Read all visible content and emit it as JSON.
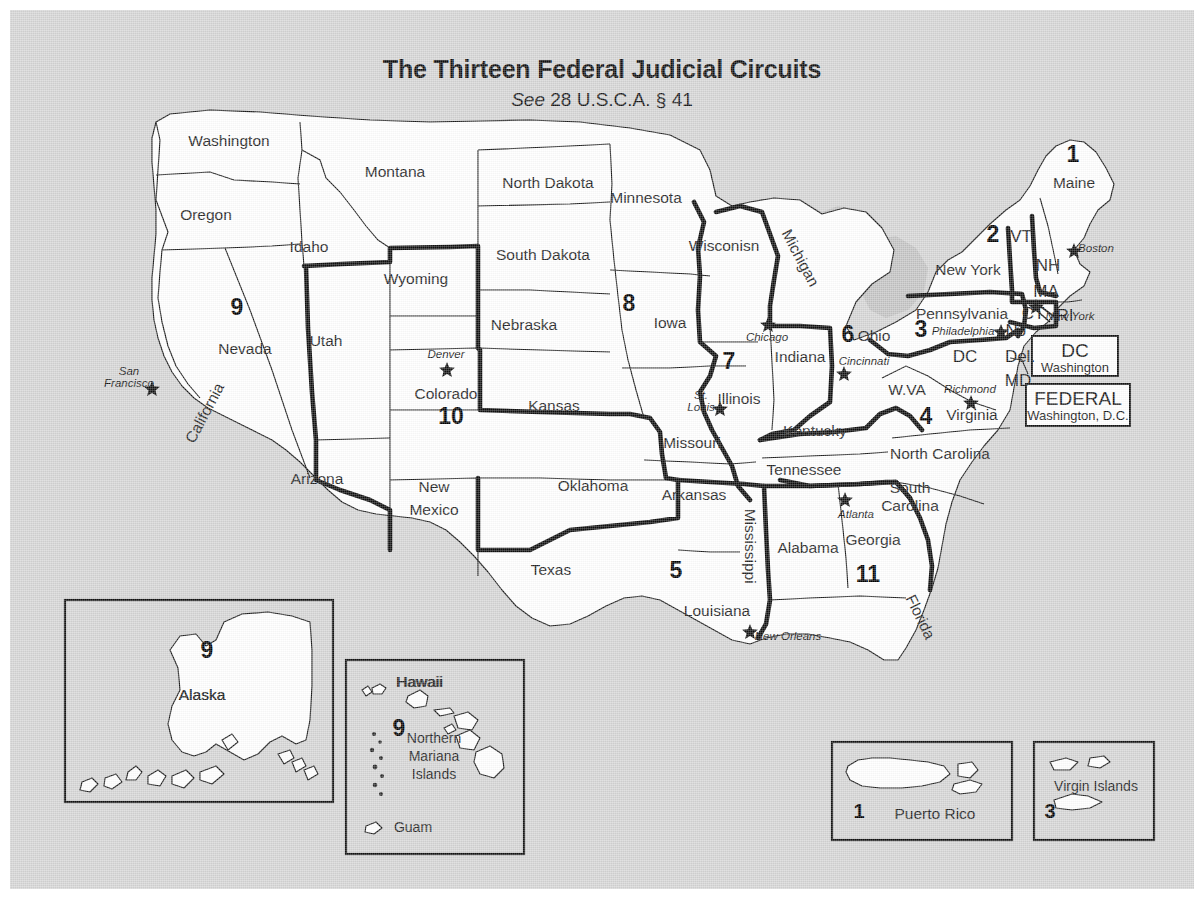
{
  "title": "The Thirteen Federal Judicial Circuits",
  "subtitle_italic": "See",
  "subtitle_rest": " 28 U.S.C.A. § 41",
  "colors": {
    "background": "#d5d5d5",
    "land": "#ffffff",
    "water": "#c3c3c3",
    "ink": "#111111",
    "circuit_boundary": "#0d0d0d"
  },
  "states": [
    {
      "name": "Washington",
      "x": 219,
      "y": 132
    },
    {
      "name": "Oregon",
      "x": 196,
      "y": 206
    },
    {
      "name": "Idaho",
      "x": 299,
      "y": 238
    },
    {
      "name": "Montana",
      "x": 385,
      "y": 163
    },
    {
      "name": "Wyoming",
      "x": 406,
      "y": 270
    },
    {
      "name": "Nevada",
      "x": 235,
      "y": 340
    },
    {
      "name": "Utah",
      "x": 316,
      "y": 332
    },
    {
      "name": "California",
      "x": 195,
      "y": 404,
      "rotate": -62
    },
    {
      "name": "Arizona",
      "x": 307,
      "y": 470
    },
    {
      "name": "New",
      "x": 424,
      "y": 478
    },
    {
      "name": "Mexico",
      "x": 424,
      "y": 501
    },
    {
      "name": "Colorado",
      "x": 436,
      "y": 385
    },
    {
      "name": "North Dakota",
      "x": 538,
      "y": 174
    },
    {
      "name": "South Dakota",
      "x": 533,
      "y": 246
    },
    {
      "name": "Nebraska",
      "x": 514,
      "y": 316
    },
    {
      "name": "Kansas",
      "x": 544,
      "y": 397
    },
    {
      "name": "Oklahoma",
      "x": 583,
      "y": 477
    },
    {
      "name": "Texas",
      "x": 541,
      "y": 561
    },
    {
      "name": "Minnesota",
      "x": 636,
      "y": 189
    },
    {
      "name": "Iowa",
      "x": 660,
      "y": 314
    },
    {
      "name": "Missouri",
      "x": 682,
      "y": 434
    },
    {
      "name": "Arkansas",
      "x": 684,
      "y": 486
    },
    {
      "name": "Louisiana",
      "x": 707,
      "y": 602
    },
    {
      "name": "Wisconisn",
      "x": 714,
      "y": 237
    },
    {
      "name": "Illinois",
      "x": 729,
      "y": 390
    },
    {
      "name": "Michigan",
      "x": 790,
      "y": 249,
      "rotate": 62
    },
    {
      "name": "Indiana",
      "x": 790,
      "y": 348
    },
    {
      "name": "Ohio",
      "x": 864,
      "y": 327
    },
    {
      "name": "Kentucky",
      "x": 805,
      "y": 422
    },
    {
      "name": "Tennessee",
      "x": 794,
      "y": 461
    },
    {
      "name": "Mississippi",
      "x": 740,
      "y": 537,
      "rotate": 90
    },
    {
      "name": "Alabama",
      "x": 798,
      "y": 539
    },
    {
      "name": "Georgia",
      "x": 863,
      "y": 531
    },
    {
      "name": "Florida",
      "x": 910,
      "y": 608,
      "rotate": 64
    },
    {
      "name": "South",
      "x": 900,
      "y": 479
    },
    {
      "name": "Carolina",
      "x": 900,
      "y": 497
    },
    {
      "name": "North Carolina",
      "x": 930,
      "y": 445
    },
    {
      "name": "Virginia",
      "x": 962,
      "y": 406
    },
    {
      "name": "W.VA",
      "x": 897,
      "y": 381
    },
    {
      "name": "Pennsylvania",
      "x": 952,
      "y": 305
    },
    {
      "name": "New York",
      "x": 958,
      "y": 261
    },
    {
      "name": "Maine",
      "x": 1064,
      "y": 174
    },
    {
      "name": "Alaska",
      "x": 192,
      "y": 686
    },
    {
      "name": "Hawaii",
      "x": 409,
      "y": 673
    }
  ],
  "abbreviations": [
    {
      "name": "VT",
      "x": 1011,
      "y": 228
    },
    {
      "name": "NH",
      "x": 1038,
      "y": 257
    },
    {
      "name": "MA",
      "x": 1036,
      "y": 283
    },
    {
      "name": "CT",
      "x": 1023,
      "y": 305
    },
    {
      "name": "RI",
      "x": 1055,
      "y": 307
    },
    {
      "name": "NJ",
      "x": 1006,
      "y": 322
    },
    {
      "name": "DC",
      "x": 955,
      "y": 348
    },
    {
      "name": "Del.",
      "x": 1010,
      "y": 348
    },
    {
      "name": "MD",
      "x": 1008,
      "y": 372
    }
  ],
  "circuit_numbers": [
    {
      "number": "9",
      "x": 227,
      "y": 299
    },
    {
      "number": "10",
      "x": 441,
      "y": 408
    },
    {
      "number": "8",
      "x": 619,
      "y": 295
    },
    {
      "number": "7",
      "x": 719,
      "y": 353
    },
    {
      "number": "5",
      "x": 666,
      "y": 562
    },
    {
      "number": "6",
      "x": 838,
      "y": 326
    },
    {
      "number": "11",
      "x": 858,
      "y": 566
    },
    {
      "number": "4",
      "x": 916,
      "y": 408
    },
    {
      "number": "3",
      "x": 911,
      "y": 321
    },
    {
      "number": "2",
      "x": 983,
      "y": 226
    },
    {
      "number": "1",
      "x": 1063,
      "y": 146
    }
  ],
  "cities": [
    {
      "name": "San\nFrancisco",
      "label": "San Francisco",
      "line1": "San",
      "line2": "Francisco",
      "x": 119,
      "y": 368,
      "star_x": 142,
      "star_y": 378
    },
    {
      "name": "Denver",
      "x": 436,
      "y": 345,
      "star_x": 437,
      "star_y": 359
    },
    {
      "name": "Chicago",
      "x": 757,
      "y": 328,
      "star_x": 758,
      "star_y": 314
    },
    {
      "name": "St.\nLouis",
      "line1": "St.",
      "line2": "Louis",
      "x": 691,
      "y": 392,
      "star_x": 710,
      "star_y": 398
    },
    {
      "name": "Cincinnati",
      "x": 854,
      "y": 352,
      "star_x": 834,
      "star_y": 363
    },
    {
      "name": "New Orleans",
      "x": 778,
      "y": 627,
      "star_x": 740,
      "star_y": 621
    },
    {
      "name": "Atlanta",
      "x": 846,
      "y": 505,
      "star_x": 835,
      "star_y": 489
    },
    {
      "name": "Richmond",
      "x": 960,
      "y": 380,
      "star_x": 961,
      "star_y": 392
    },
    {
      "name": "Philadelphia",
      "x": 953,
      "y": 322,
      "star_x": 991,
      "star_y": 321
    },
    {
      "name": "Boston",
      "x": 1086,
      "y": 239,
      "star_x": 1064,
      "star_y": 240
    },
    {
      "name": "New York",
      "x": 1060,
      "y": 307,
      "star_x": 1026,
      "star_y": 296
    }
  ],
  "label_boxes": [
    {
      "title": "DC",
      "subtitle": "Washington",
      "x": 1022,
      "y": 326,
      "w": 86,
      "h": 40
    },
    {
      "title": "FEDERAL",
      "subtitle": "Washington, D.C.",
      "x": 1016,
      "y": 374,
      "w": 104,
      "h": 42
    }
  ],
  "insets": [
    {
      "name": "alaska",
      "caption": "Alaska",
      "circuit": "9",
      "x": 55,
      "y": 590,
      "w": 268,
      "h": 202
    },
    {
      "name": "hawaii",
      "caption": "Hawaii",
      "circuit": "9",
      "x": 336,
      "y": 650,
      "w": 178,
      "h": 194,
      "extra": [
        "Northern",
        "Mariana",
        "Islands",
        "Guam"
      ]
    },
    {
      "name": "puerto-rico",
      "caption": "Puerto Rico",
      "circuit": "1",
      "x": 822,
      "y": 732,
      "w": 180,
      "h": 98
    },
    {
      "name": "virgin-islands",
      "caption": "Virgin Islands",
      "circuit": "3",
      "x": 1024,
      "y": 732,
      "w": 120,
      "h": 98
    }
  ],
  "inset_text": {
    "northern": "Northern",
    "mariana": "Mariana",
    "islands": "Islands",
    "guam": "Guam",
    "hawaii": "Hawaii",
    "alaska": "Alaska",
    "puerto_rico": "Puerto Rico",
    "virgin_islands": "Virgin Islands"
  }
}
